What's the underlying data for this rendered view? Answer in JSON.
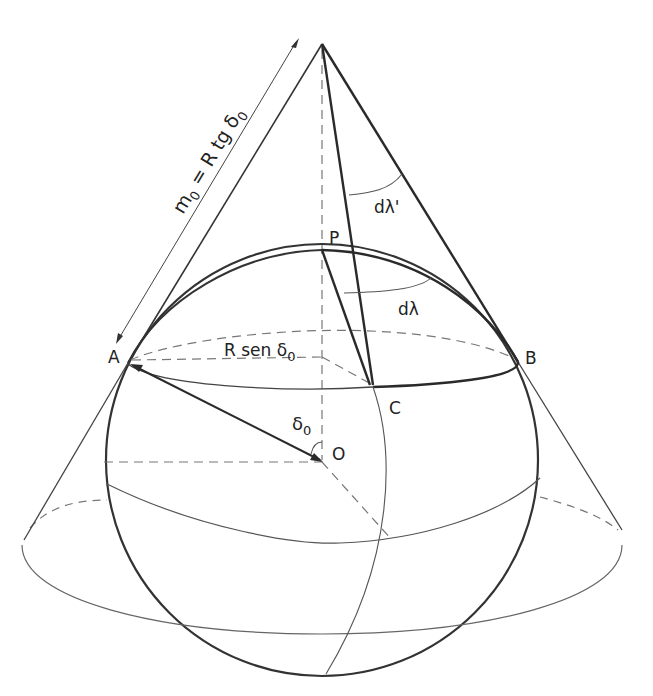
{
  "diagram": {
    "type": "geometry",
    "points": {
      "A": "A",
      "B": "B",
      "C": "C",
      "P": "P",
      "O": "O"
    },
    "labels": {
      "slant_main": "m",
      "slant_sub": "0",
      "slant_eq": " = R tg δ",
      "slant_eq_sub": "0",
      "radius_main": "R sen δ",
      "radius_sub": "0",
      "angle_main": "δ",
      "angle_sub": "0",
      "dlambda_prime": "dλ'",
      "dlambda": "dλ"
    },
    "colors": {
      "ink": "#2a2a2a",
      "thin": "#555555",
      "dash": "#777777"
    }
  }
}
